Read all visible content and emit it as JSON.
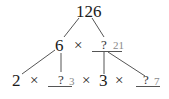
{
  "diagram": {
    "type": "factor-tree",
    "root": {
      "value": "126"
    },
    "level1": {
      "left": {
        "value": "6"
      },
      "operator": "×",
      "right": {
        "value": "?",
        "answer": "21"
      }
    },
    "level2": [
      {
        "value": "2"
      },
      {
        "operator": "×"
      },
      {
        "value": "?",
        "answer": "3"
      },
      {
        "operator": "×"
      },
      {
        "value": "3"
      },
      {
        "operator": "×"
      },
      {
        "value": "?",
        "answer": "7"
      }
    ],
    "colors": {
      "ink": "#1a1a1a",
      "answer": "#8a8a8a",
      "line": "#555555"
    }
  }
}
